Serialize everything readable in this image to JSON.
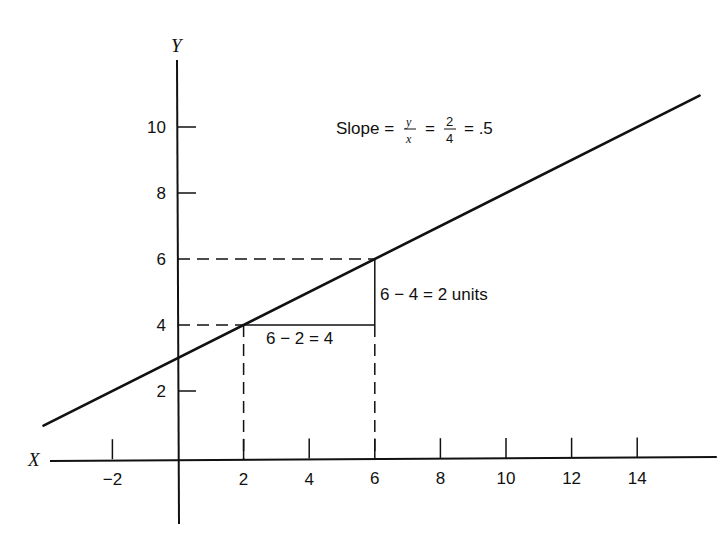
{
  "chart_data": {
    "type": "line",
    "title": "",
    "xlabel": "X",
    "ylabel": "Y",
    "xlim": [
      -4,
      16
    ],
    "ylim": [
      -2.5,
      12
    ],
    "grid": false,
    "x_ticks": [
      -2,
      2,
      4,
      6,
      8,
      10,
      12,
      14
    ],
    "x_tick_labels": [
      "−2",
      "2",
      "4",
      "6",
      "8",
      "10",
      "12",
      "14"
    ],
    "y_ticks": [
      2,
      4,
      6,
      8,
      10
    ],
    "y_tick_labels": [
      "2",
      "4",
      "6",
      "8",
      "10"
    ],
    "series": [
      {
        "name": "line",
        "x": [
          -4.1,
          15.9
        ],
        "y": [
          0.95,
          10.95
        ],
        "slope": 0.5,
        "intercept": 3
      }
    ],
    "guides": {
      "point_a": {
        "x": 2,
        "y": 4
      },
      "point_b": {
        "x": 6,
        "y": 6
      }
    },
    "annotations": {
      "slope_prefix": "Slope =",
      "slope_num": "y",
      "slope_den": "x",
      "eq1": "=",
      "num2": "2",
      "den2": "4",
      "eq2": "= .5",
      "rise": "6 − 4 = 2 units",
      "run": "6 − 2 = 4"
    }
  }
}
